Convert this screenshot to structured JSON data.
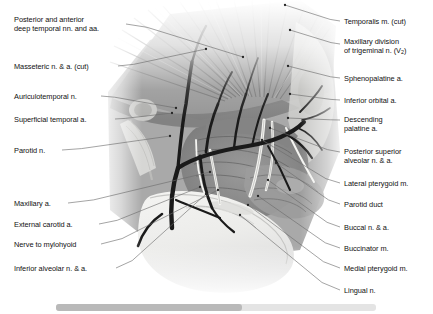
{
  "figure": {
    "background_color": "#ffffff",
    "leader_line_color": "#6b6b6b",
    "text_color": "#111111",
    "palette": {
      "muscle_mid": "#8d8d8d",
      "muscle_dark": "#5c5c5c",
      "muscle_light": "#c2c2c2",
      "bone_pale": "#e9e9e7",
      "vessel_dark": "#1d1d1d",
      "nerve_pale": "#f2f2ef",
      "fade_white": "#ffffff"
    }
  },
  "labels_left": [
    {
      "id": "deep-temporal",
      "line1": "Posterior and anterior",
      "line2": "deep temporal nn. and aa.",
      "x": 14,
      "y": 16,
      "anchor_x": 126,
      "anchor_y": 24,
      "target_x": 243,
      "target_y": 57
    },
    {
      "id": "masseteric",
      "line1": "Masseteric n. & a. (cut)",
      "line2": "",
      "x": 14,
      "y": 63,
      "anchor_x": 118,
      "anchor_y": 66,
      "target_x": 206,
      "target_y": 49
    },
    {
      "id": "auriculotemporal",
      "line1": "Auriculotemporal n.",
      "line2": "",
      "x": 14,
      "y": 93,
      "anchor_x": 101,
      "anchor_y": 96,
      "target_x": 176,
      "target_y": 108
    },
    {
      "id": "superficial-temporal",
      "line1": "Superficial temporal a.",
      "line2": "",
      "x": 14,
      "y": 116,
      "anchor_x": 115,
      "anchor_y": 119,
      "target_x": 172,
      "target_y": 113
    },
    {
      "id": "parotid-n",
      "line1": "Parotid n.",
      "line2": "",
      "x": 14,
      "y": 147,
      "anchor_x": 62,
      "anchor_y": 150,
      "target_x": 170,
      "target_y": 136
    },
    {
      "id": "maxillary-a",
      "line1": "Maxillary a.",
      "line2": "",
      "x": 14,
      "y": 200,
      "anchor_x": 68,
      "anchor_y": 203,
      "target_x": 210,
      "target_y": 172
    },
    {
      "id": "external-carotid",
      "line1": "External carotid a.",
      "line2": "",
      "x": 14,
      "y": 221,
      "anchor_x": 99,
      "anchor_y": 224,
      "target_x": 200,
      "target_y": 187
    },
    {
      "id": "nerve-mylohyoid",
      "line1": "Nerve to mylohyoid",
      "line2": "",
      "x": 14,
      "y": 241,
      "anchor_x": 101,
      "anchor_y": 244,
      "target_x": 218,
      "target_y": 190
    },
    {
      "id": "inferior-alveolar",
      "line1": "Inferior alveolar n. & a.",
      "line2": "",
      "x": 14,
      "y": 265,
      "anchor_x": 116,
      "anchor_y": 268,
      "target_x": 206,
      "target_y": 194
    }
  ],
  "labels_right": [
    {
      "id": "temporalis",
      "line1": "Temporalis m. (cut)",
      "line2": "",
      "x": 344,
      "y": 18,
      "anchor_x": 340,
      "anchor_y": 21,
      "target_x": 285,
      "target_y": 5
    },
    {
      "id": "maxillary-division",
      "line1": "Maxillary division",
      "line2": "of trigeminal n. (V2)",
      "x": 344,
      "y": 38,
      "anchor_x": 340,
      "anchor_y": 44,
      "target_x": 290,
      "target_y": 30
    },
    {
      "id": "sphenopalatine",
      "line1": "Sphenopalatine a.",
      "line2": "",
      "x": 344,
      "y": 75,
      "anchor_x": 340,
      "anchor_y": 78,
      "target_x": 288,
      "target_y": 66
    },
    {
      "id": "inferior-orbital",
      "line1": "Inferior orbital a.",
      "line2": "",
      "x": 344,
      "y": 97,
      "anchor_x": 340,
      "anchor_y": 100,
      "target_x": 290,
      "target_y": 94
    },
    {
      "id": "descending-palatine",
      "line1": "Descending",
      "line2": "palatine a.",
      "x": 344,
      "y": 116,
      "anchor_x": 340,
      "anchor_y": 120,
      "target_x": 288,
      "target_y": 118
    },
    {
      "id": "posterior-superior-alveolar",
      "line1": "Posterior superior",
      "line2": "alveolar n. & a.",
      "x": 344,
      "y": 148,
      "anchor_x": 340,
      "anchor_y": 152,
      "target_x": 270,
      "target_y": 128
    },
    {
      "id": "lateral-pterygoid",
      "line1": "Lateral pterygoid m.",
      "line2": "",
      "x": 344,
      "y": 180,
      "anchor_x": 340,
      "anchor_y": 183,
      "target_x": 262,
      "target_y": 140
    },
    {
      "id": "parotid-duct",
      "line1": "Parotid duct",
      "line2": "",
      "x": 344,
      "y": 201,
      "anchor_x": 340,
      "anchor_y": 204,
      "target_x": 276,
      "target_y": 163
    },
    {
      "id": "buccal",
      "line1": "Buccal n. & a.",
      "line2": "",
      "x": 344,
      "y": 224,
      "anchor_x": 340,
      "anchor_y": 227,
      "target_x": 268,
      "target_y": 180
    },
    {
      "id": "buccinator",
      "line1": "Buccinator m.",
      "line2": "",
      "x": 344,
      "y": 245,
      "anchor_x": 340,
      "anchor_y": 248,
      "target_x": 258,
      "target_y": 196
    },
    {
      "id": "medial-pterygoid",
      "line1": "Medial pterygoid m.",
      "line2": "",
      "x": 344,
      "y": 265,
      "anchor_x": 340,
      "anchor_y": 268,
      "target_x": 248,
      "target_y": 205
    },
    {
      "id": "lingual",
      "line1": "Lingual n.",
      "line2": "",
      "x": 344,
      "y": 287,
      "anchor_x": 340,
      "anchor_y": 290,
      "target_x": 240,
      "target_y": 215
    }
  ],
  "bottom_bar": {
    "track_color": "#e4e4e4",
    "fill_color": "#b9b9b9"
  }
}
